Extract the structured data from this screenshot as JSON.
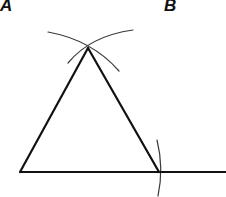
{
  "diagram": {
    "labels": {
      "a": "A",
      "b": "B"
    },
    "colors": {
      "stroke": "#111111",
      "arc": "#333333",
      "background": "#ffffff"
    },
    "points": {
      "left_vertex": [
        20,
        172
      ],
      "right_vertex": [
        159,
        172
      ],
      "apex": [
        88,
        48
      ]
    },
    "baseline": {
      "from": [
        20,
        172
      ],
      "to": [
        226,
        172
      ]
    },
    "arcs": [
      {
        "name": "apex-arc-from-left",
        "from": [
          48,
          32
        ],
        "to": [
          119,
          71
        ]
      },
      {
        "name": "apex-arc-from-right",
        "from": [
          68,
          63
        ],
        "to": [
          133,
          30
        ]
      },
      {
        "name": "baseline-arc",
        "from": [
          157,
          140
        ],
        "to": [
          158,
          196
        ]
      }
    ]
  }
}
